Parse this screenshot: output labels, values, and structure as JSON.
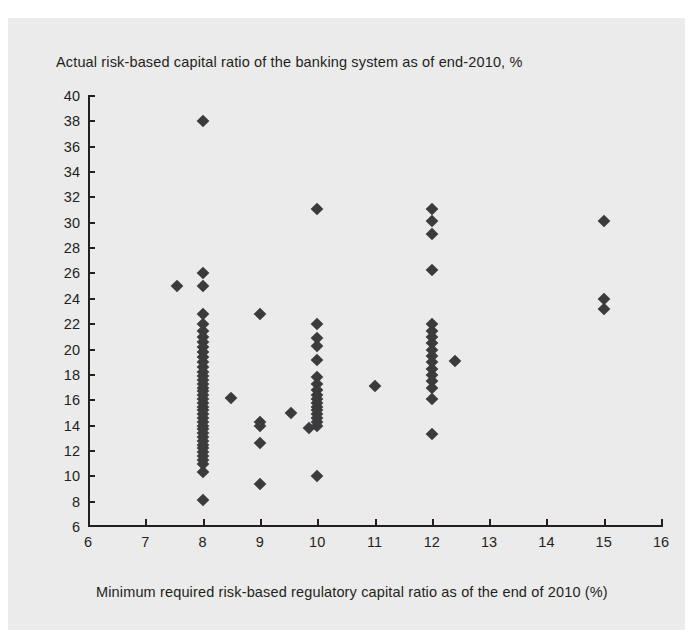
{
  "chart_data": {
    "type": "scatter",
    "title": "Actual risk-based capital ratio of the banking system as of end-2010, %",
    "xlabel": "Minimum required risk-based regulatory capital ratio as of the end of 2010 (%)",
    "ylabel": "",
    "xlim": [
      6,
      16
    ],
    "ylim": [
      6,
      40
    ],
    "xticks": [
      6,
      7,
      8,
      9,
      10,
      11,
      12,
      13,
      14,
      15,
      16
    ],
    "yticks": [
      6,
      8,
      10,
      12,
      14,
      16,
      18,
      20,
      22,
      24,
      26,
      28,
      30,
      32,
      34,
      36,
      38,
      40
    ],
    "grid": false,
    "legend": false,
    "marker": "diamond",
    "marker_color": "#3b3b3d",
    "background_color": "#ebebeb",
    "axis_color": "#231f20",
    "points": [
      {
        "x": 7.55,
        "y": 25.0
      },
      {
        "x": 8.0,
        "y": 38.0
      },
      {
        "x": 8.0,
        "y": 26.0
      },
      {
        "x": 8.0,
        "y": 25.0
      },
      {
        "x": 8.0,
        "y": 22.8
      },
      {
        "x": 8.0,
        "y": 22.0
      },
      {
        "x": 8.0,
        "y": 21.5
      },
      {
        "x": 8.0,
        "y": 21.0
      },
      {
        "x": 8.0,
        "y": 20.6
      },
      {
        "x": 8.0,
        "y": 20.2
      },
      {
        "x": 8.0,
        "y": 19.8
      },
      {
        "x": 8.0,
        "y": 19.4
      },
      {
        "x": 8.0,
        "y": 19.0
      },
      {
        "x": 8.0,
        "y": 18.6
      },
      {
        "x": 8.0,
        "y": 18.2
      },
      {
        "x": 8.0,
        "y": 17.9
      },
      {
        "x": 8.0,
        "y": 17.6
      },
      {
        "x": 8.0,
        "y": 17.3
      },
      {
        "x": 8.0,
        "y": 17.0
      },
      {
        "x": 8.0,
        "y": 16.7
      },
      {
        "x": 8.0,
        "y": 16.4
      },
      {
        "x": 8.0,
        "y": 16.1
      },
      {
        "x": 8.0,
        "y": 15.8
      },
      {
        "x": 8.0,
        "y": 15.5
      },
      {
        "x": 8.0,
        "y": 15.2
      },
      {
        "x": 8.0,
        "y": 14.9
      },
      {
        "x": 8.0,
        "y": 14.6
      },
      {
        "x": 8.0,
        "y": 14.3
      },
      {
        "x": 8.0,
        "y": 14.0
      },
      {
        "x": 8.0,
        "y": 13.7
      },
      {
        "x": 8.0,
        "y": 13.4
      },
      {
        "x": 8.0,
        "y": 13.1
      },
      {
        "x": 8.0,
        "y": 12.8
      },
      {
        "x": 8.0,
        "y": 12.5
      },
      {
        "x": 8.0,
        "y": 12.2
      },
      {
        "x": 8.0,
        "y": 11.9
      },
      {
        "x": 8.0,
        "y": 11.6
      },
      {
        "x": 8.0,
        "y": 11.3
      },
      {
        "x": 8.0,
        "y": 11.0
      },
      {
        "x": 8.0,
        "y": 10.3
      },
      {
        "x": 8.0,
        "y": 8.1
      },
      {
        "x": 8.5,
        "y": 16.2
      },
      {
        "x": 9.0,
        "y": 22.8
      },
      {
        "x": 9.0,
        "y": 14.3
      },
      {
        "x": 9.0,
        "y": 14.0
      },
      {
        "x": 9.0,
        "y": 12.6
      },
      {
        "x": 9.0,
        "y": 9.4
      },
      {
        "x": 9.55,
        "y": 15.0
      },
      {
        "x": 9.85,
        "y": 13.8
      },
      {
        "x": 10.0,
        "y": 31.1
      },
      {
        "x": 10.0,
        "y": 22.0
      },
      {
        "x": 10.0,
        "y": 20.9
      },
      {
        "x": 10.0,
        "y": 20.3
      },
      {
        "x": 10.0,
        "y": 19.2
      },
      {
        "x": 10.0,
        "y": 17.8
      },
      {
        "x": 10.0,
        "y": 17.3
      },
      {
        "x": 10.0,
        "y": 16.8
      },
      {
        "x": 10.0,
        "y": 16.4
      },
      {
        "x": 10.0,
        "y": 16.1
      },
      {
        "x": 10.0,
        "y": 15.8
      },
      {
        "x": 10.0,
        "y": 15.5
      },
      {
        "x": 10.0,
        "y": 15.2
      },
      {
        "x": 10.0,
        "y": 14.9
      },
      {
        "x": 10.0,
        "y": 14.6
      },
      {
        "x": 10.0,
        "y": 14.3
      },
      {
        "x": 10.0,
        "y": 14.0
      },
      {
        "x": 10.0,
        "y": 10.0
      },
      {
        "x": 11.0,
        "y": 17.1
      },
      {
        "x": 12.0,
        "y": 31.1
      },
      {
        "x": 12.0,
        "y": 30.1
      },
      {
        "x": 12.0,
        "y": 29.1
      },
      {
        "x": 12.0,
        "y": 26.3
      },
      {
        "x": 12.0,
        "y": 22.0
      },
      {
        "x": 12.0,
        "y": 21.5
      },
      {
        "x": 12.0,
        "y": 21.0
      },
      {
        "x": 12.0,
        "y": 20.5
      },
      {
        "x": 12.0,
        "y": 20.0
      },
      {
        "x": 12.0,
        "y": 19.5
      },
      {
        "x": 12.0,
        "y": 19.0
      },
      {
        "x": 12.0,
        "y": 18.5
      },
      {
        "x": 12.0,
        "y": 18.0
      },
      {
        "x": 12.0,
        "y": 17.5
      },
      {
        "x": 12.0,
        "y": 17.0
      },
      {
        "x": 12.0,
        "y": 16.1
      },
      {
        "x": 12.0,
        "y": 13.3
      },
      {
        "x": 12.4,
        "y": 19.1
      },
      {
        "x": 15.0,
        "y": 30.1
      },
      {
        "x": 15.0,
        "y": 24.0
      },
      {
        "x": 15.0,
        "y": 23.2
      }
    ]
  }
}
